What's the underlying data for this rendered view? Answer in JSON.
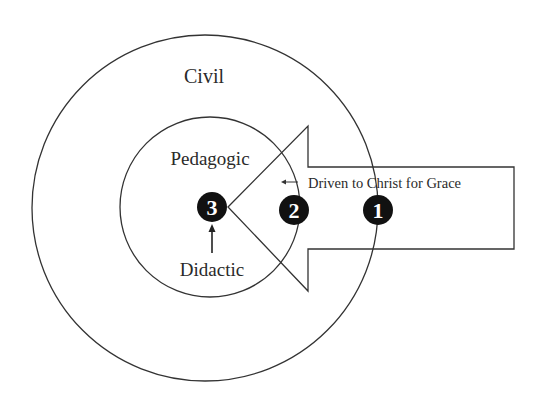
{
  "diagram": {
    "rings": [
      {
        "id": "outer",
        "label": "Civil"
      },
      {
        "id": "inner",
        "label": "Pedagogic"
      }
    ],
    "center_label": "Didactic",
    "arrow_label": "Driven to Christ for Grace",
    "markers": [
      {
        "number": "1"
      },
      {
        "number": "2"
      },
      {
        "number": "3"
      }
    ],
    "colors": {
      "line": "#333333",
      "marker_fill": "#111111",
      "marker_text": "#ffffff",
      "background": "#ffffff"
    }
  }
}
